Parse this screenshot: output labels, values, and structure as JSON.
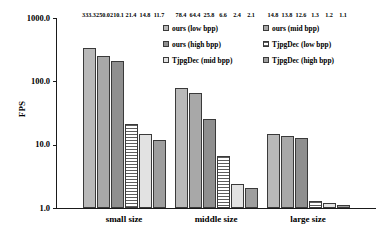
{
  "chart_data": {
    "type": "bar",
    "title": "",
    "xlabel": "",
    "ylabel": "FPS",
    "scale": "log",
    "ylim": [
      1.0,
      1000.0
    ],
    "yticks": [
      "1000.0",
      "100.0",
      "10.0",
      "1.0"
    ],
    "grid": false,
    "legend_position": "top-right",
    "categories": [
      "small size",
      "middle size",
      "large size"
    ],
    "series": [
      {
        "name": "ours (low bpp)",
        "values": [
          333.3,
          78.4,
          14.8
        ]
      },
      {
        "name": "ours (mid bpp)",
        "values": [
          250.0,
          64.4,
          13.8
        ]
      },
      {
        "name": "ours (high bpp)",
        "values": [
          210.1,
          25.8,
          12.6
        ]
      },
      {
        "name": "TjpgDec (low bpp)",
        "values": [
          21.4,
          6.6,
          1.3
        ]
      },
      {
        "name": "TjpgDec (mid bpp)",
        "values": [
          14.8,
          2.4,
          1.2
        ]
      },
      {
        "name": "TjpgDec (high bpp)",
        "values": [
          11.7,
          2.1,
          1.1
        ]
      }
    ],
    "value_labels": {
      "small size": [
        "333.3",
        "250.0",
        "210.1",
        "21.4",
        "14.8",
        "11.7"
      ],
      "middle size": [
        "78.4",
        "64.4",
        "25.8",
        "6.6",
        "2.4",
        "2.1"
      ],
      "large size": [
        "14.8",
        "13.8",
        "12.6",
        "1.3",
        "1.2",
        "1.1"
      ]
    }
  },
  "axis": {
    "y_title": "FPS",
    "y_ticks": {
      "t1000": "1000.0",
      "t100": "100.0",
      "t10": "10.0",
      "t1": "1.0"
    },
    "x_ticks": {
      "g1": "small size",
      "g2": "middle size",
      "g3": "large size"
    }
  },
  "legend": {
    "items": [
      {
        "label": "ours (low bpp)",
        "swatch": "fill-s0"
      },
      {
        "label": "ours (mid bpp)",
        "swatch": "fill-s1"
      },
      {
        "label": "ours (high bpp)",
        "swatch": "fill-s2"
      },
      {
        "label": "TjpgDec (low bpp)",
        "swatch": "fill-s3"
      },
      {
        "label": "TjpgDec (mid bpp)",
        "swatch": "fill-s4"
      },
      {
        "label": "TjpgDec (high bpp)",
        "swatch": "fill-s5"
      }
    ]
  },
  "colors": {
    "axis": "#1a1a1a",
    "text": "#000000",
    "background": "#ffffff",
    "s0": "#b9b9b9",
    "s1": "#a8a8a8",
    "s2": "#8f8f8f",
    "s3": "#5d5d5d",
    "s4": "#e2e2e2",
    "s5": "#9e9e9e"
  }
}
